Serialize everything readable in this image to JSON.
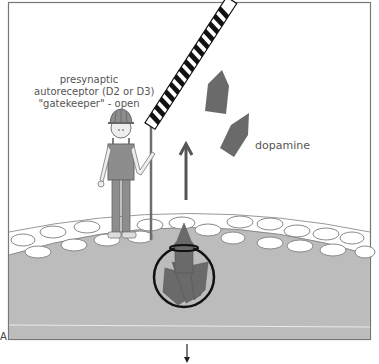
{
  "figure": {
    "panel_letter": "A",
    "annotation": {
      "lines": [
        "presynaptic",
        "autoreceptor (D2 or D3)",
        "\"gatekeeper\" - open"
      ]
    },
    "dopamine_label": "dopamine",
    "elements": {
      "gatekeeper": "construction-worker-figure",
      "gate": "striped-barrier-arm-raised",
      "arrow_up": "release-direction-arrow",
      "arrow_down": "continuation-arrow",
      "vesicle": "dopamine-vesicle-circle",
      "membrane": "presynaptic-membrane-with-receptors"
    },
    "colors": {
      "frame": "#777777",
      "membrane_fill": "#bcbcbc",
      "dopamine": "#6a6a6a",
      "worker_clothes": "#8d8d8d",
      "text": "#555555",
      "gate_stripe": "#111111"
    }
  }
}
